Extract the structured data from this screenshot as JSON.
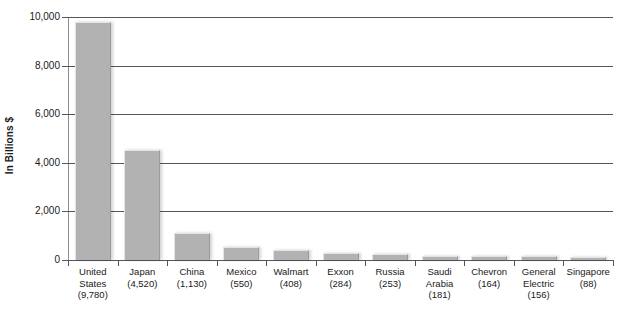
{
  "chart_data": {
    "type": "bar",
    "title": "",
    "xlabel": "",
    "ylabel": "In Billions $",
    "ylim": [
      0,
      10000
    ],
    "ytick_labels": [
      "10,000",
      "8,000",
      "6,000",
      "4,000",
      "2,000",
      "0"
    ],
    "ytick_values": [
      10000,
      8000,
      6000,
      4000,
      2000,
      0
    ],
    "grid": true,
    "legend": "none",
    "categories": [
      "United States",
      "Japan",
      "China",
      "Mexico",
      "Walmart",
      "Exxon",
      "Russia",
      "Saudi Arabia",
      "Chevron",
      "General Electric",
      "Singapore"
    ],
    "values": [
      9780,
      4520,
      1130,
      550,
      408,
      284,
      253,
      181,
      164,
      156,
      88
    ],
    "value_labels": [
      "(9,780)",
      "(4,520)",
      "(1,130)",
      "(550)",
      "(408)",
      "(284)",
      "(253)",
      "(181)",
      "(164)",
      "(156)",
      "(88)"
    ],
    "category_lines": [
      [
        "United",
        "States"
      ],
      [
        "Japan"
      ],
      [
        "China"
      ],
      [
        "Mexico"
      ],
      [
        "Walmart"
      ],
      [
        "Exxon"
      ],
      [
        "Russia"
      ],
      [
        "Saudi",
        "Arabia"
      ],
      [
        "Chevron"
      ],
      [
        "General",
        "Electric"
      ],
      [
        "Singapore"
      ]
    ],
    "bar_color": "#b2b2b2",
    "gridline_color": "#54565a",
    "axis_color": "#8c8e90",
    "text_color": "#1a1a1a"
  }
}
